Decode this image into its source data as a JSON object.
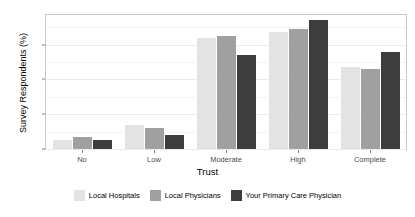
{
  "chart_data": {
    "type": "bar",
    "title": "",
    "xlabel": "Trust",
    "ylabel": "Survey Respondents (%)",
    "categories": [
      "No",
      "Low",
      "Moderate",
      "High",
      "Complete"
    ],
    "series": [
      {
        "name": "Local Hospitals",
        "color": "#e3e3e3",
        "values": [
          2.5,
          7.0,
          32.0,
          33.5,
          23.5
        ]
      },
      {
        "name": "Local Physicians",
        "color": "#a0a0a0",
        "values": [
          3.5,
          6.0,
          32.5,
          34.5,
          23.0
        ]
      },
      {
        "name": "Your Primary Care Physician",
        "color": "#3d3d3d",
        "values": [
          2.5,
          4.0,
          27.0,
          37.0,
          28.0
        ]
      }
    ],
    "ylim": [
      0,
      38.5
    ],
    "yticks": [
      0,
      10,
      20,
      30
    ],
    "ytick_labels": [
      "0",
      "10",
      "20",
      "30"
    ],
    "grid": true,
    "legend_position": "bottom",
    "panel_border_color": "#c9c9c9",
    "grid_color": "#ebebeb",
    "background": "#ffffff"
  }
}
